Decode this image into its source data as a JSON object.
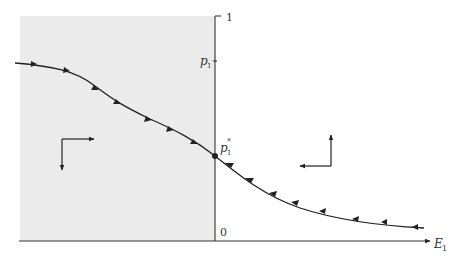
{
  "diagram": {
    "type": "phase-diagram",
    "shaded_region_color": "#ebebeb",
    "axes": {
      "x_label": "E",
      "x_label_sub": "1",
      "y_top_label": "1",
      "origin_label": "0"
    },
    "labels": {
      "p1": "p",
      "p1_sub": "1",
      "p1_star": "p",
      "p1_star_sub": "1",
      "p1_star_sup": "*"
    },
    "curve": {
      "description": "Saddle path through p1* with arrows converging toward p1* from both sides",
      "left_arrows_count": 8,
      "right_arrows_count": 8
    },
    "direction_indicators": [
      {
        "region": "left",
        "horizontal": "right",
        "vertical": "down"
      },
      {
        "region": "right",
        "horizontal": "left",
        "vertical": "up"
      }
    ],
    "colors": {
      "line": "#222222",
      "shade": "#ebebeb",
      "text": "#333333"
    }
  }
}
